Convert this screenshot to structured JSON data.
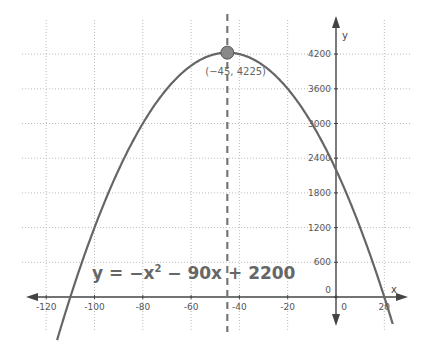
{
  "chart_data": {
    "type": "line",
    "title": "",
    "function": "y = -x^2 - 90x + 2200",
    "equation_label": {
      "lhs": "y = −x",
      "exp": "2",
      "rhs": " − 90x + 2200"
    },
    "xlabel": "x",
    "ylabel": "y",
    "xlim": [
      -128,
      24
    ],
    "ylim": [
      -600,
      4500
    ],
    "x_ticks": [
      -120,
      -100,
      -80,
      -60,
      -40,
      -20,
      0,
      20
    ],
    "x_tick_labels": [
      "-120",
      "-100",
      "-80",
      "-60",
      "-40",
      "-20",
      "0",
      "20"
    ],
    "y_ticks": [
      0,
      600,
      1200,
      1800,
      2400,
      3000,
      3600,
      4200
    ],
    "y_tick_labels": [
      "0",
      "600",
      "1200",
      "1800",
      "2400",
      "3000",
      "3600",
      "4200"
    ],
    "grid": true,
    "vertex": {
      "x": -45,
      "y": 4225,
      "label": "(−45, 4225)"
    },
    "axis_of_symmetry": {
      "x": -45,
      "style": "dashed"
    },
    "roots": [
      -110,
      20
    ],
    "y_intercept": 2200,
    "series": [
      {
        "name": "y = -x^2 - 90x + 2200",
        "x": [
          -115,
          -110,
          -100,
          -90,
          -80,
          -70,
          -60,
          -50,
          -45,
          -40,
          -30,
          -20,
          -10,
          0,
          10,
          20,
          23
        ],
        "y": [
          -575,
          0,
          1200,
          2200,
          3000,
          3600,
          4000,
          4200,
          4225,
          4200,
          4000,
          3600,
          3000,
          2200,
          1200,
          0,
          -713
        ]
      }
    ],
    "colors": {
      "curve": "#666666",
      "axes": "#444444",
      "grid": "#bbbbbb",
      "vertex_fill": "#888888",
      "dashed_line": "#777777"
    }
  }
}
